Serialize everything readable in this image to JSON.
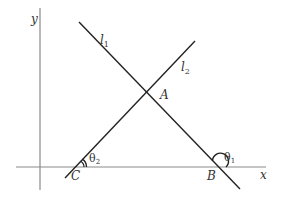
{
  "diagram": {
    "axes": {
      "x_label": "x",
      "y_label": "y",
      "axis_color": "#888888"
    },
    "lines": [
      {
        "name": "l",
        "subscript": "1",
        "color": "#222222"
      },
      {
        "name": "l",
        "subscript": "2",
        "color": "#222222"
      }
    ],
    "points": {
      "A": "A",
      "B": "B",
      "C": "C"
    },
    "angles": [
      {
        "symbol": "θ",
        "subscript": "1",
        "at": "B"
      },
      {
        "symbol": "θ",
        "subscript": "2",
        "at": "C"
      }
    ]
  }
}
